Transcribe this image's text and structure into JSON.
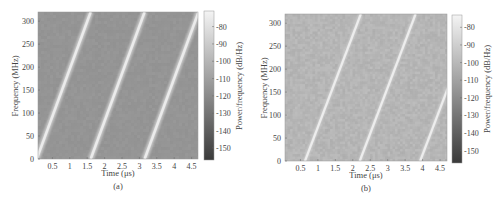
{
  "chart_data": [
    {
      "type": "heatmap",
      "subtype": "spectrogram",
      "caption": "(a)",
      "title": "",
      "xlabel": "Time (μs)",
      "ylabel": "Frequency (MHz)",
      "xlim": [
        0.08,
        4.7
      ],
      "ylim": [
        0,
        320
      ],
      "xticks": [
        0.5,
        1,
        1.5,
        2,
        2.5,
        3,
        3.5,
        4,
        4.5
      ],
      "xtick_labels": [
        "0.5",
        "1",
        "1.5",
        "2",
        "2.5",
        "3",
        "3.5",
        "4",
        "4.5"
      ],
      "yticks": [
        0,
        50,
        100,
        150,
        200,
        250,
        300
      ],
      "ytick_labels": [
        "0",
        "50",
        "100",
        "150",
        "200",
        "250",
        "300"
      ],
      "colorbar": {
        "label": "Power/frequency (dB/Hz)",
        "range": [
          -157,
          -71
        ],
        "ticks": [
          -80,
          -90,
          -100,
          -110,
          -120,
          -130,
          -140,
          -150
        ],
        "tick_labels": [
          "-80",
          "-90",
          "-100",
          "-110",
          "-120",
          "-130",
          "-140",
          "-150"
        ]
      },
      "background_level_db": -115,
      "chirps": [
        {
          "t_start": 0.05,
          "t_end": 1.6,
          "f_start": 0,
          "f_end": 320,
          "level_db": -75
        },
        {
          "t_start": 1.6,
          "t_end": 3.15,
          "f_start": 0,
          "f_end": 320,
          "level_db": -75
        },
        {
          "t_start": 3.15,
          "t_end": 4.7,
          "f_start": 0,
          "f_end": 320,
          "level_db": -75
        }
      ],
      "noise": "low"
    },
    {
      "type": "heatmap",
      "subtype": "spectrogram",
      "caption": "(b)",
      "title": "",
      "xlabel": "Time (μs)",
      "ylabel": "Frequency (MHz)",
      "xlim": [
        0.06,
        4.7
      ],
      "ylim": [
        0,
        320
      ],
      "xticks": [
        0.5,
        1,
        1.5,
        2,
        2.5,
        3,
        3.5,
        4,
        4.5
      ],
      "xtick_labels": [
        "0.5",
        "1",
        "1.5",
        "2",
        "2.5",
        "3",
        "3.5",
        "4",
        "4.5"
      ],
      "yticks": [
        0,
        50,
        100,
        150,
        200,
        250,
        300
      ],
      "ytick_labels": [
        "0",
        "50",
        "100",
        "150",
        "200",
        "250",
        "300"
      ],
      "colorbar": {
        "label": "Power/frequency (dB/Hz)",
        "range": [
          -157,
          -73
        ],
        "ticks": [
          -80,
          -90,
          -100,
          -110,
          -120,
          -130,
          -140,
          -150
        ],
        "tick_labels": [
          "-80",
          "-90",
          "-100",
          "-110",
          "-120",
          "-130",
          "-140",
          "-150"
        ]
      },
      "background_level_db": -101,
      "chirps": [
        {
          "t_start": 0.63,
          "t_end": 2.23,
          "f_start": 0,
          "f_end": 320,
          "level_db": -76
        },
        {
          "t_start": 2.2,
          "t_end": 3.8,
          "f_start": 0,
          "f_end": 320,
          "level_db": -76
        },
        {
          "t_start": 3.93,
          "t_end": 5.53,
          "f_start": 0,
          "f_end": 320,
          "level_db": -76
        }
      ],
      "noise": "high"
    }
  ]
}
